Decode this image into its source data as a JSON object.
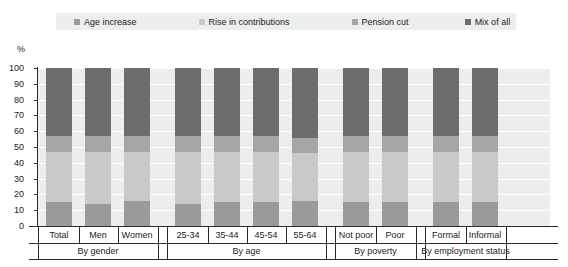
{
  "chart_data": {
    "type": "bar",
    "subtype": "stacked-bar-100",
    "title": "",
    "xlabel": "",
    "ylabel": "%",
    "ylim": [
      0,
      100
    ],
    "ytick_step": 10,
    "grid": true,
    "legend_position": "top",
    "categories": [
      "Total",
      "Men",
      "Women",
      "25-34",
      "35-44",
      "45-54",
      "55-64",
      "Not poor",
      "Poor",
      "Formal",
      "Informal"
    ],
    "groups": [
      {
        "label": "By gender",
        "categories": [
          "Total",
          "Men",
          "Women"
        ]
      },
      {
        "label": "By age",
        "categories": [
          "25-34",
          "35-44",
          "45-54",
          "55-64"
        ]
      },
      {
        "label": "By poverty",
        "categories": [
          "Not poor",
          "Poor"
        ]
      },
      {
        "label": "By employment status",
        "categories": [
          "Formal",
          "Informal"
        ]
      }
    ],
    "series": [
      {
        "name": "Age increase",
        "color": "#9a9a9a",
        "values": [
          15,
          14,
          16,
          14,
          15,
          15,
          16,
          15,
          15,
          15,
          15
        ]
      },
      {
        "name": "Rise in contributions",
        "color": "#c9c9c9",
        "values": [
          32,
          33,
          31,
          33,
          32,
          32,
          30,
          32,
          32,
          32,
          32
        ]
      },
      {
        "name": "Pension cut",
        "color": "#a6a6a6",
        "values": [
          10,
          10,
          10,
          10,
          10,
          10,
          10,
          10,
          10,
          10,
          10
        ]
      },
      {
        "name": "Mix of all",
        "color": "#6d6d6d",
        "values": [
          43,
          43,
          43,
          43,
          43,
          43,
          44,
          43,
          43,
          43,
          43
        ]
      }
    ],
    "ytick_labels": [
      "0",
      "10",
      "20",
      "30",
      "40",
      "50",
      "60",
      "70",
      "80",
      "90",
      "100"
    ]
  },
  "legend": {
    "items": [
      {
        "label": "Age increase",
        "color": "#9a9a9a"
      },
      {
        "label": "Rise in contributions",
        "color": "#c9c9c9"
      },
      {
        "label": "Pension cut",
        "color": "#a6a6a6"
      },
      {
        "label": "Mix of all",
        "color": "#6d6d6d"
      }
    ]
  },
  "axis": {
    "y_unit": "%"
  }
}
